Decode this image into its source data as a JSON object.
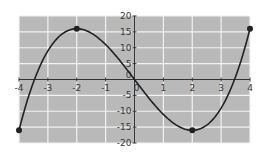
{
  "chart_data": {
    "type": "line",
    "title": "",
    "xlabel": "",
    "ylabel": "",
    "function": "f(x) = x^3 - 12x",
    "xlim": [
      -4,
      4
    ],
    "ylim": [
      -20,
      20
    ],
    "grid": true,
    "legend": null,
    "x_ticks": [
      -4,
      -3,
      -2,
      -1,
      0,
      1,
      2,
      3,
      4
    ],
    "y_ticks": [
      -20,
      -15,
      -10,
      -5,
      0,
      5,
      10,
      15,
      20
    ],
    "x_tick_labels": [
      "-4",
      "-3",
      "-2",
      "-1",
      "0",
      "1",
      "2",
      "3",
      "4"
    ],
    "y_tick_labels": [
      "-20",
      "-15",
      "-10",
      "-5",
      "0",
      "5",
      "10",
      "15",
      "20"
    ],
    "series": [
      {
        "name": "curve",
        "x": [
          -4,
          -3.5,
          -3,
          -2.5,
          -2,
          -1.5,
          -1,
          -0.5,
          0,
          0.5,
          1,
          1.5,
          2,
          2.5,
          3,
          3.5,
          4
        ],
        "values": [
          -16,
          1.125,
          9,
          14.375,
          16,
          14.625,
          11,
          5.875,
          0,
          -5.875,
          -11,
          -14.625,
          -16,
          -14.375,
          -9,
          -1.125,
          16
        ]
      }
    ],
    "marked_points": [
      {
        "x": -4,
        "y": -16
      },
      {
        "x": -2,
        "y": 16
      },
      {
        "x": 0,
        "y": 0
      },
      {
        "x": 2,
        "y": -16
      },
      {
        "x": 4,
        "y": 16
      }
    ],
    "colors": {
      "plot_background": "#b9b9b9",
      "grid": "#f2f2f2",
      "curve": "#222222",
      "axis": "#333333"
    }
  }
}
